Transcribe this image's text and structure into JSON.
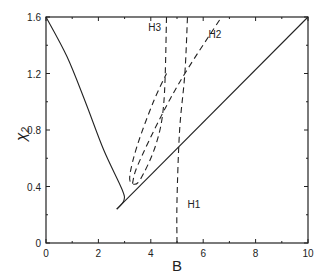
{
  "chart_data": {
    "type": "line",
    "title": "",
    "xlabel": "B",
    "ylabel": "χ2",
    "xlim": [
      0,
      10
    ],
    "ylim": [
      0,
      1.6
    ],
    "xticks": [
      0,
      2,
      4,
      6,
      8,
      10
    ],
    "yticks": [
      0,
      0.4,
      0.8,
      1.2,
      1.6
    ],
    "xtick_labels": [
      "0",
      "2",
      "4",
      "6",
      "8",
      "10"
    ],
    "ytick_labels": [
      "0",
      "0.4",
      "0.8",
      "1.2",
      "1.6"
    ],
    "grid": false,
    "legend": null,
    "series": [
      {
        "name": "boundary-left",
        "style": "solid",
        "points": [
          [
            0,
            1.6
          ],
          [
            0.8,
            1.32
          ],
          [
            1.5,
            1.0
          ],
          [
            2.2,
            0.66
          ],
          [
            2.9,
            0.38
          ],
          [
            2.97,
            0.3
          ],
          [
            2.7,
            0.24
          ]
        ]
      },
      {
        "name": "boundary-right",
        "style": "solid",
        "points": [
          [
            2.7,
            0.24
          ],
          [
            10,
            1.6
          ]
        ]
      },
      {
        "name": "H1",
        "style": "dashed",
        "points": [
          [
            5.0,
            0
          ],
          [
            5.0,
            0.3
          ],
          [
            5.1,
            0.8
          ],
          [
            5.3,
            1.2
          ],
          [
            5.4,
            1.6
          ]
        ]
      },
      {
        "name": "H2",
        "style": "dashed",
        "points": [
          [
            3.3,
            0.42
          ],
          [
            3.5,
            0.55
          ],
          [
            4.4,
            0.9
          ],
          [
            5.3,
            1.2
          ],
          [
            6.7,
            1.6
          ]
        ]
      },
      {
        "name": "H3",
        "style": "dashed",
        "points": [
          [
            4.6,
            1.6
          ],
          [
            4.5,
            1.0
          ],
          [
            4.2,
            0.7
          ],
          [
            3.6,
            0.45
          ],
          [
            3.3,
            0.42
          ],
          [
            3.2,
            0.48
          ],
          [
            3.5,
            0.7
          ],
          [
            4.1,
            1.0
          ],
          [
            4.6,
            1.2
          ]
        ]
      }
    ],
    "annotations": [
      {
        "text": "H1",
        "x": 5.4,
        "y": 0.25
      },
      {
        "text": "H2",
        "x": 6.2,
        "y": 1.45
      },
      {
        "text": "H3",
        "x": 3.9,
        "y": 1.5
      }
    ]
  },
  "labels": {
    "xlabel": "B",
    "ylabel_main": "χ",
    "ylabel_sub": "2",
    "annotations": [
      "H1",
      "H2",
      "H3"
    ]
  }
}
